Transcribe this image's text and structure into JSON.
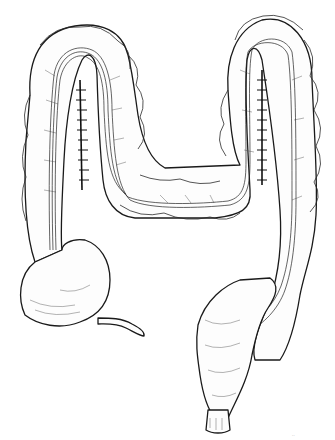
{
  "figure": {
    "style": "black-and-white line drawing",
    "background_color": "#ffffff",
    "ink_color": "#1a1a1a",
    "parts": [
      "ascending-colon-left-loop",
      "transverse-colon",
      "descending-colon-right-loop",
      "cecum",
      "appendix",
      "sigmoid-colon",
      "rectum",
      "left-suture-line",
      "right-suture-line",
      "inserted-tube"
    ],
    "signature": "··"
  }
}
